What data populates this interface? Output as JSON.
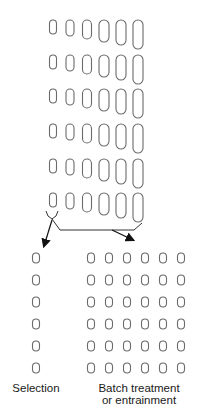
{
  "diagram": {
    "colors": {
      "stroke": "#6b6b6b",
      "arrow": "#111111",
      "text": "#1a1a1a"
    },
    "source_culture": {
      "rows": 6,
      "columns": 6,
      "row_tops": [
        20,
        55,
        89,
        124,
        159,
        193
      ],
      "column_x": [
        53,
        67,
        81,
        95,
        109,
        123,
        138
      ],
      "cell_widths": [
        7,
        8,
        9,
        10,
        10,
        10
      ],
      "cell_heights": [
        14,
        16,
        19,
        22,
        25,
        29
      ],
      "description": "Asynchronous population: each row shows cells at increasing sizes (cell-cycle stages)"
    },
    "selection_output": {
      "columns": 1,
      "rows": 6,
      "column_x": [
        36
      ],
      "row_tops": [
        253,
        275,
        297,
        319,
        341,
        363
      ],
      "cell_width": 7,
      "cell_height": 10
    },
    "batch_output": {
      "columns": 6,
      "rows": 6,
      "column_x": [
        91,
        109,
        127,
        145,
        163,
        181
      ],
      "row_tops": [
        253,
        275,
        297,
        319,
        341,
        363
      ],
      "cell_width": 7,
      "cell_height": 10
    },
    "labels": {
      "selection": "Selection",
      "batch_line1": "Batch treatment",
      "batch_line2": "or entrainment"
    },
    "arrows": [
      {
        "name": "selection-arrow",
        "from": [
          52,
          222
        ],
        "to": [
          44,
          248
        ]
      },
      {
        "name": "batch-arrow",
        "from": [
          112,
          230
        ],
        "to": [
          135,
          241
        ]
      }
    ]
  }
}
